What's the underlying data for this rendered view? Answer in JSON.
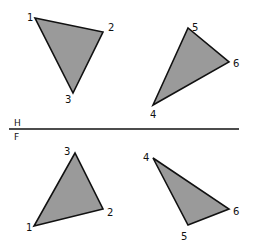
{
  "diagram": {
    "fill_color": "#9a9a9a",
    "stroke_color": "#111111",
    "folding_line": {
      "x1": 9,
      "y1": 129,
      "x2": 239,
      "y2": 129,
      "label_top": "H",
      "label_bottom": "F"
    },
    "views": [
      {
        "name": "top-view",
        "plane": "H",
        "triangles": [
          {
            "name": "triangle-123-top",
            "points": [
              [
                35,
                18
              ],
              [
                103,
                32
              ],
              [
                73,
                93
              ]
            ],
            "vertices": [
              {
                "label": "1",
                "x": 35,
                "y": 18,
                "lx": 27,
                "ly": 21
              },
              {
                "label": "2",
                "x": 103,
                "y": 32,
                "lx": 108,
                "ly": 31
              },
              {
                "label": "3",
                "x": 73,
                "y": 93,
                "lx": 65,
                "ly": 103
              }
            ]
          },
          {
            "name": "triangle-456-top",
            "points": [
              [
                153,
                105
              ],
              [
                188,
                28
              ],
              [
                229,
                62
              ]
            ],
            "vertices": [
              {
                "label": "4",
                "x": 153,
                "y": 105,
                "lx": 150,
                "ly": 118
              },
              {
                "label": "5",
                "x": 188,
                "y": 28,
                "lx": 192,
                "ly": 31
              },
              {
                "label": "6",
                "x": 229,
                "y": 62,
                "lx": 233,
                "ly": 67
              }
            ]
          }
        ]
      },
      {
        "name": "front-view",
        "plane": "F",
        "triangles": [
          {
            "name": "triangle-123-front",
            "points": [
              [
                34,
                226
              ],
              [
                103,
                209
              ],
              [
                75,
                153
              ]
            ],
            "vertices": [
              {
                "label": "1",
                "x": 34,
                "y": 226,
                "lx": 26,
                "ly": 231
              },
              {
                "label": "2",
                "x": 103,
                "y": 209,
                "lx": 107,
                "ly": 216
              },
              {
                "label": "3",
                "x": 75,
                "y": 153,
                "lx": 64,
                "ly": 155
              }
            ]
          },
          {
            "name": "triangle-456-front",
            "points": [
              [
                153,
                158
              ],
              [
                229,
                209
              ],
              [
                188,
                225
              ]
            ],
            "vertices": [
              {
                "label": "4",
                "x": 153,
                "y": 158,
                "lx": 143,
                "ly": 161
              },
              {
                "label": "5",
                "x": 188,
                "y": 225,
                "lx": 181,
                "ly": 240
              },
              {
                "label": "6",
                "x": 229,
                "y": 209,
                "lx": 233,
                "ly": 215
              }
            ]
          }
        ]
      }
    ]
  }
}
